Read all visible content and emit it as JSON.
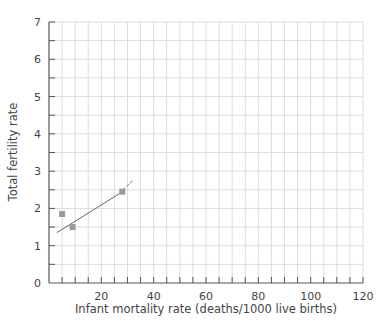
{
  "clipped_header_text": "",
  "chart_data": {
    "type": "scatter",
    "title": "",
    "xlabel": "Infant mortality rate (deaths/1000 live births)",
    "ylabel": "Total fertility rate",
    "xlim": [
      0,
      120
    ],
    "ylim": [
      0,
      7
    ],
    "xticks": [
      20,
      40,
      60,
      80,
      100,
      120
    ],
    "yticks": [
      0,
      1,
      2,
      3,
      4,
      5,
      6,
      7
    ],
    "x_minor_step": 5,
    "y_minor_step": 0.5,
    "grid": true,
    "legend": null,
    "series": [
      {
        "name": "countries",
        "marker": "square",
        "color": "#9a9a9a",
        "points": [
          {
            "x": 5,
            "y": 1.85
          },
          {
            "x": 9,
            "y": 1.5
          },
          {
            "x": 28,
            "y": 2.45
          }
        ]
      }
    ],
    "trendline": {
      "color": "#666666",
      "solid": {
        "x0": 3,
        "y0": 1.35,
        "x1": 27,
        "y1": 2.4
      },
      "dashed": {
        "x0": 27,
        "y0": 2.4,
        "x1": 32,
        "y1": 2.75
      }
    }
  },
  "colors": {
    "axis": "#555555",
    "grid": "#dddddd",
    "text": "#444444"
  }
}
